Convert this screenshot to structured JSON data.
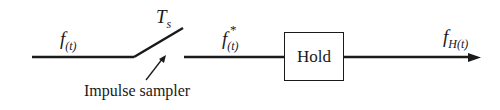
{
  "diagram": {
    "input_signal": {
      "base": "f",
      "sub": "(t)"
    },
    "sample_period": {
      "base": "T",
      "sub": "s"
    },
    "sampled_signal": {
      "base": "f",
      "sup": "*",
      "sub": "(t)"
    },
    "hold_block": {
      "label": "Hold"
    },
    "output_signal": {
      "base": "f",
      "sub": "H(t)"
    },
    "sampler_caption": "Impulse sampler"
  }
}
